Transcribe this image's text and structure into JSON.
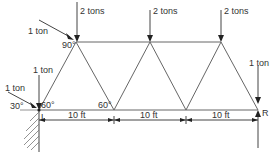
{
  "diagram": {
    "type": "truss",
    "loads": {
      "top_left_vertical": "2 tons",
      "top_middle_vertical": "2 tons",
      "top_right_vertical": "2 tons",
      "top_left_inclined": "1 ton",
      "left_support_vertical": "1 ton",
      "left_support_inclined": "1 ton",
      "right_support_vertical": "1 ton"
    },
    "angles": {
      "top_left": "90°",
      "left_inclined_load": "30°",
      "left_support": "60°",
      "bottom_middle": "60°"
    },
    "supports": {
      "left": "L",
      "right": "R"
    },
    "dimensions": [
      "10 ft",
      "10 ft",
      "10 ft"
    ]
  }
}
